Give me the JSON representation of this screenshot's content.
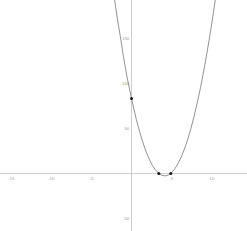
{
  "figure": {
    "name": "quadratic-function-plot",
    "background_color": "#ffffff",
    "axis_color": "#b9b9b9",
    "curve_color": "#6f6f6f",
    "marker_color": "#1a1a1a",
    "tick_label_color": "#9a9a9a"
  },
  "chart_data": {
    "type": "line",
    "title": "",
    "subtitle": "",
    "xlabel": "",
    "ylabel": "",
    "grid": false,
    "legend": null,
    "function": "y = 5x^2 - 41.5x + 83.3",
    "xlim": [
      -16.4,
      14.4
    ],
    "ylim": [
      -64,
      193
    ],
    "xticks": [
      -15,
      -10,
      -5,
      5,
      10
    ],
    "xtick_labels": [
      "-15",
      "-10",
      "-5",
      "5",
      "10"
    ],
    "yticks": [
      150,
      100,
      50,
      -50
    ],
    "ytick_labels": [
      "150",
      "100",
      "50",
      "-50"
    ],
    "x_axis_position": 0,
    "y_axis_position": 0,
    "series": [
      {
        "name": "parabola",
        "type": "line",
        "color": "#6f6f6f",
        "x": [
          -2.2,
          -1.8,
          -1.4,
          -1.0,
          -0.6,
          -0.2,
          0.2,
          0.6,
          1.0,
          1.4,
          1.8,
          2.2,
          2.6,
          3.0,
          3.4,
          3.8,
          4.2,
          4.6,
          5.0,
          5.4,
          5.8,
          6.2,
          6.6,
          7.0,
          7.4,
          7.8,
          8.2,
          8.6,
          9.0,
          9.4,
          9.8,
          10.2,
          10.5
        ],
        "y": [
          198.8,
          174.1,
          152.6,
          129.8,
          109.3,
          91.8,
          75.2,
          60.1,
          46.8,
          35.0,
          24.7,
          16.1,
          9.0,
          3.8,
          0.0,
          -2.1,
          -2.7,
          -1.7,
          1.0,
          5.2,
          11.0,
          18.4,
          27.3,
          37.8,
          49.9,
          63.5,
          78.7,
          95.5,
          113.8,
          133.7,
          155.2,
          178.2,
          196.5
        ]
      }
    ],
    "markers": [
      {
        "name": "root-left",
        "x": 3.4,
        "y": 0,
        "label": ""
      },
      {
        "name": "root-right",
        "x": 4.9,
        "y": 0,
        "label": ""
      },
      {
        "name": "y-intercept",
        "x": 0.0,
        "y": 83.3,
        "label": ""
      }
    ]
  }
}
